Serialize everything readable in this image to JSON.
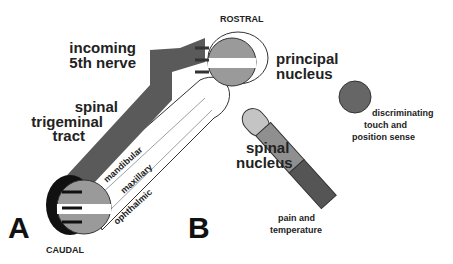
{
  "panel_a": {
    "letter": "A",
    "labels": {
      "incoming_1": "incoming",
      "incoming_2": "5th nerve",
      "tract_1": "spinal",
      "tract_2": "trigeminal",
      "tract_3": "tract",
      "rostral": "ROSTRAL",
      "caudal": "CAUDAL",
      "principal_1": "principal",
      "principal_2": "nucleus",
      "spinal_nucleus_1": "spinal",
      "spinal_nucleus_2": "nucleus",
      "div_mandibular": "mandibular",
      "div_maxillary": "maxillary",
      "div_ophthalmic": "ophthalmic"
    }
  },
  "panel_b": {
    "letter": "B",
    "labels": {
      "top_1": "discriminating",
      "top_2": "touch and",
      "top_3": "position sense",
      "bottom_1": "pain and",
      "bottom_2": "temperature"
    }
  },
  "colors": {
    "dark": "#555555",
    "medium": "#8f8f8f",
    "light": "#c4c4c4",
    "tract": "#5a5a5a"
  }
}
